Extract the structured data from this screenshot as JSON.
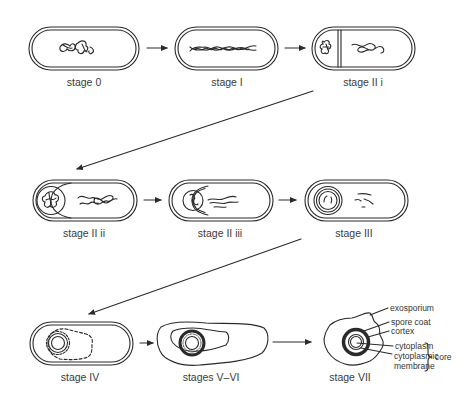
{
  "diagram": {
    "title": "",
    "stages": [
      {
        "id": "stage-0",
        "label": "stage 0"
      },
      {
        "id": "stage-1",
        "label": "stage I"
      },
      {
        "id": "stage-2i",
        "label": "stage II i"
      },
      {
        "id": "stage-2ii",
        "label": "stage II ii"
      },
      {
        "id": "stage-2iii",
        "label": "stage II iii"
      },
      {
        "id": "stage-3",
        "label": "stage III"
      },
      {
        "id": "stage-4",
        "label": "stage IV"
      },
      {
        "id": "stage-5-6",
        "label": "stages V–VI"
      },
      {
        "id": "stage-7",
        "label": "stage VII"
      }
    ],
    "annotations": {
      "exosporium": "exosporium",
      "spore_coat": "spore coat",
      "cortex": "cortex",
      "cytoplasm": "cytoplasm",
      "cytoplasmic_membrane_1": "cytoplasmic",
      "cytoplasmic_membrane_2": "membrane",
      "core": "core"
    },
    "colors": {
      "stroke": "#2a2a2a",
      "background": "#ffffff"
    }
  }
}
